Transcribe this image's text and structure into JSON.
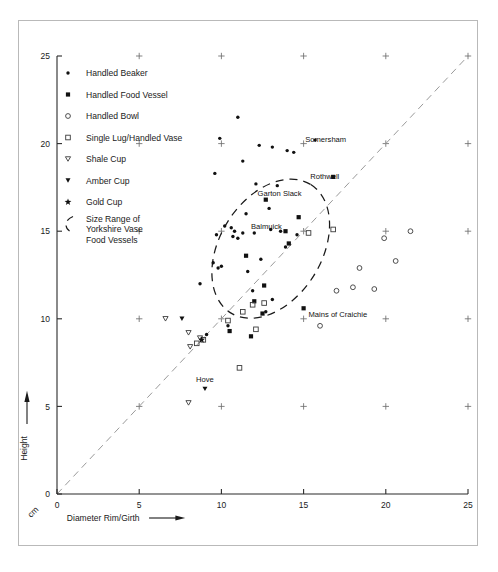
{
  "figure": {
    "title": "",
    "units_label": "cm"
  },
  "axes": {
    "xlabel": "Diameter Rim/Girth",
    "ylabel": "Height",
    "xticks": [
      0,
      5,
      10,
      15,
      20,
      25
    ],
    "yticks": [
      0,
      5,
      10,
      15,
      20,
      25
    ],
    "xlim": [
      0,
      25
    ],
    "ylim": [
      0,
      25
    ]
  },
  "legend": {
    "items": [
      {
        "marker": "small-dot",
        "label": "Handled Beaker"
      },
      {
        "marker": "filled-square",
        "label": "Handled Food Vessel"
      },
      {
        "marker": "open-circle",
        "label": "Handled Bowl"
      },
      {
        "marker": "open-square",
        "label": "Single Lug/Handled Vase"
      },
      {
        "marker": "open-triangle-down",
        "label": "Shale Cup"
      },
      {
        "marker": "filled-triangle-down",
        "label": "Amber Cup"
      },
      {
        "marker": "star",
        "label": "Gold Cup"
      },
      {
        "marker": "dashed-ellipse",
        "label": "Size Range of Yorkshire Vase Food Vessels",
        "label_lines": [
          "Size Range of",
          "Yorkshire Vase",
          "Food Vessels"
        ]
      }
    ]
  },
  "annotations": [
    {
      "text": "Somersham",
      "x": 15.1,
      "y": 20.1,
      "anchor": "start"
    },
    {
      "text": "Rothwell",
      "x": 15.4,
      "y": 18.0,
      "anchor": "start"
    },
    {
      "text": "Garton Slack",
      "x": 12.2,
      "y": 17.0,
      "anchor": "start"
    },
    {
      "text": "Balmuick",
      "x": 11.8,
      "y": 15.1,
      "anchor": "start"
    },
    {
      "text": "Mains of Craichie",
      "x": 15.3,
      "y": 10.1,
      "anchor": "start"
    },
    {
      "text": "Hove",
      "x": 9.0,
      "y": 6.4,
      "anchor": "middle"
    }
  ],
  "chart_data": {
    "type": "scatter",
    "title": "",
    "xlabel": "Diameter Rim/Girth",
    "ylabel": "Height",
    "xlim": [
      0,
      25
    ],
    "ylim": [
      0,
      25
    ],
    "grid": false,
    "legend_position": "upper-left-inside",
    "reference_line": {
      "name": "1:1 diagonal",
      "style": "dashed",
      "from": [
        0,
        0
      ],
      "to": [
        25,
        25
      ]
    },
    "size_range_region": {
      "name": "Size Range of Yorkshire Vase Food Vessels",
      "style": "dashed-ellipse",
      "center": [
        13.0,
        14.0
      ],
      "rx": 4.6,
      "ry": 2.9,
      "rotation_deg": -58
    },
    "grid_crosses": {
      "note": "small plus marks at 5-unit lattice intersections",
      "x": [
        5,
        10,
        15,
        20,
        25
      ],
      "y": [
        5,
        10,
        15,
        20,
        25
      ]
    },
    "series": [
      {
        "name": "Handled Beaker",
        "marker": "small-dot",
        "points": [
          [
            11.0,
            21.5
          ],
          [
            9.9,
            20.3
          ],
          [
            12.3,
            19.9
          ],
          [
            13.1,
            19.8
          ],
          [
            14.0,
            19.6
          ],
          [
            14.4,
            19.5
          ],
          [
            15.7,
            20.2
          ],
          [
            11.3,
            19.0
          ],
          [
            9.6,
            18.3
          ],
          [
            12.1,
            17.7
          ],
          [
            13.4,
            17.6
          ],
          [
            12.9,
            16.3
          ],
          [
            11.5,
            16.0
          ],
          [
            10.2,
            15.3
          ],
          [
            10.6,
            15.2
          ],
          [
            10.8,
            15.0
          ],
          [
            10.7,
            14.7
          ],
          [
            11.0,
            14.6
          ],
          [
            11.3,
            14.9
          ],
          [
            9.7,
            14.8
          ],
          [
            12.0,
            14.9
          ],
          [
            13.0,
            15.1
          ],
          [
            13.6,
            15.0
          ],
          [
            14.6,
            14.8
          ],
          [
            13.9,
            14.1
          ],
          [
            12.4,
            13.4
          ],
          [
            9.5,
            13.2
          ],
          [
            9.8,
            12.9
          ],
          [
            10.0,
            13.0
          ],
          [
            11.6,
            12.7
          ],
          [
            8.7,
            12.0
          ],
          [
            11.9,
            11.6
          ],
          [
            13.1,
            11.1
          ],
          [
            12.7,
            10.4
          ],
          [
            9.1,
            9.1
          ],
          [
            10.4,
            9.6
          ]
        ]
      },
      {
        "name": "Handled Food Vessel",
        "marker": "filled-square",
        "points": [
          [
            16.8,
            18.1
          ],
          [
            12.7,
            16.8
          ],
          [
            14.7,
            15.8
          ],
          [
            13.9,
            15.0
          ],
          [
            11.5,
            13.6
          ],
          [
            12.6,
            11.9
          ],
          [
            12.0,
            11.0
          ],
          [
            12.5,
            10.3
          ],
          [
            15.0,
            10.6
          ],
          [
            10.5,
            9.3
          ],
          [
            11.8,
            9.0
          ],
          [
            14.1,
            14.3
          ]
        ]
      },
      {
        "name": "Handled Bowl",
        "marker": "open-circle",
        "points": [
          [
            21.5,
            15.0
          ],
          [
            19.9,
            14.6
          ],
          [
            20.6,
            13.3
          ],
          [
            18.4,
            12.9
          ],
          [
            18.0,
            11.8
          ],
          [
            19.3,
            11.7
          ],
          [
            16.0,
            9.6
          ],
          [
            17.0,
            11.6
          ]
        ]
      },
      {
        "name": "Single Lug/Handled Vase",
        "marker": "open-square",
        "points": [
          [
            16.8,
            15.1
          ],
          [
            11.9,
            10.8
          ],
          [
            12.6,
            10.9
          ],
          [
            11.3,
            10.4
          ],
          [
            10.4,
            9.9
          ],
          [
            12.1,
            9.4
          ],
          [
            8.9,
            8.8
          ],
          [
            8.5,
            8.6
          ],
          [
            11.1,
            7.2
          ],
          [
            15.3,
            14.9
          ]
        ]
      },
      {
        "name": "Shale Cup",
        "marker": "open-triangle-down",
        "points": [
          [
            6.6,
            10.0
          ],
          [
            8.0,
            9.2
          ],
          [
            8.7,
            8.9
          ],
          [
            8.1,
            8.4
          ],
          [
            8.0,
            5.2
          ]
        ]
      },
      {
        "name": "Amber Cup",
        "marker": "filled-triangle-down",
        "points": [
          [
            7.6,
            10.0
          ],
          [
            9.0,
            6.0
          ]
        ]
      },
      {
        "name": "Gold Cup",
        "marker": "star",
        "points": [
          [
            8.8,
            8.8
          ]
        ]
      }
    ]
  }
}
